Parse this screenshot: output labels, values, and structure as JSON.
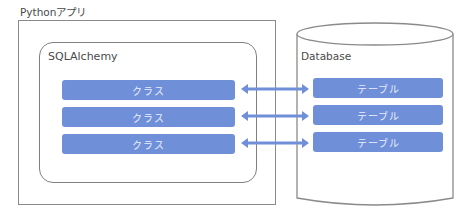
{
  "diagram": {
    "app_label": "Pythonアプリ",
    "orm_label": "SQLAlchemy",
    "db_label": "Database",
    "classes": [
      {
        "label": "クラス"
      },
      {
        "label": "クラス"
      },
      {
        "label": "クラス"
      }
    ],
    "tables": [
      {
        "label": "テーブル"
      },
      {
        "label": "テーブル"
      },
      {
        "label": "テーブル"
      }
    ],
    "connectors": [
      {
        "type": "bidirectional-arrow",
        "from": "class-0",
        "to": "table-0"
      },
      {
        "type": "bidirectional-arrow",
        "from": "class-1",
        "to": "table-1"
      },
      {
        "type": "bidirectional-arrow",
        "from": "class-2",
        "to": "table-2"
      }
    ],
    "colors": {
      "bar_fill": "#6f8fd8",
      "bar_text": "#e8eefc",
      "outline": "#808080",
      "arrow": "#6f8fd8"
    }
  }
}
